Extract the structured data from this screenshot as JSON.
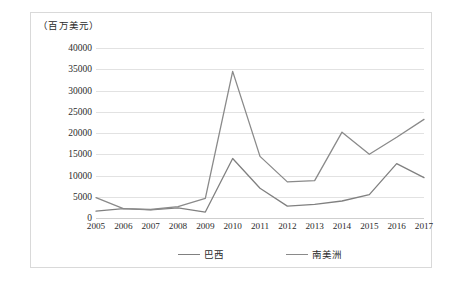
{
  "chart_data": {
    "type": "line",
    "title": "",
    "subtitle": "",
    "unit_caption": "（百万美元）",
    "xlabel": "",
    "ylabel": "",
    "ylim": [
      0,
      40000
    ],
    "ytick_step": 5000,
    "grid": true,
    "legend_position": "bottom",
    "categories": [
      "2005",
      "2006",
      "2007",
      "2008",
      "2009",
      "2010",
      "2011",
      "2012",
      "2013",
      "2014",
      "2015",
      "2016",
      "2017"
    ],
    "yticks": [
      "0",
      "5000",
      "10000",
      "15000",
      "20000",
      "25000",
      "30000",
      "35000",
      "40000"
    ],
    "series": [
      {
        "name": "巴西",
        "color": "#808080",
        "values": [
          1600,
          2200,
          1900,
          2400,
          1400,
          14000,
          7000,
          2800,
          3200,
          4000,
          5500,
          12800,
          9500
        ]
      },
      {
        "name": "南美洲",
        "color": "#8a8a8a",
        "values": [
          4800,
          2200,
          2000,
          2700,
          4600,
          34500,
          14500,
          8500,
          8800,
          20200,
          15000,
          19000,
          23200
        ]
      }
    ]
  },
  "colors": {
    "frame_border": "#d9d9d9",
    "grid": "#e2e2e2",
    "axis": "#cfcfcf",
    "text": "#2b2b2b",
    "line": "#808080",
    "background": "#ffffff"
  }
}
